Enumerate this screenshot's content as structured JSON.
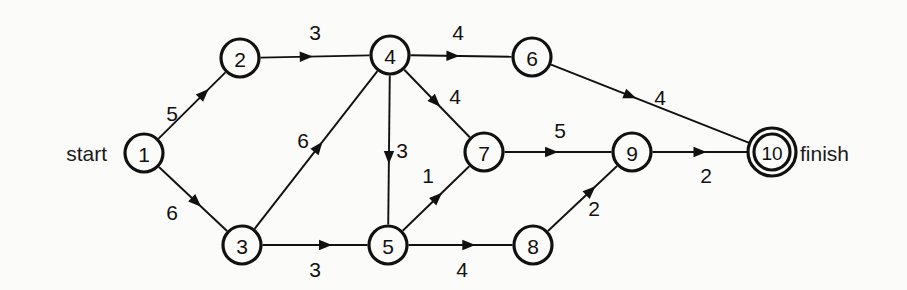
{
  "figure": {
    "type": "directed-network-graph",
    "background_color": "#fbfbf9",
    "ink_color": "#111111",
    "width": 907,
    "height": 290
  },
  "terminals": {
    "start_label": "start",
    "finish_label": "finish",
    "start_node": "1",
    "finish_node": "10"
  },
  "nodes": [
    {
      "id": "1",
      "label": "1",
      "x": 144,
      "y": 153,
      "r": 19,
      "double": false
    },
    {
      "id": "2",
      "label": "2",
      "x": 240,
      "y": 58,
      "r": 19,
      "double": false
    },
    {
      "id": "3",
      "label": "3",
      "x": 242,
      "y": 245,
      "r": 19,
      "double": false
    },
    {
      "id": "4",
      "label": "4",
      "x": 390,
      "y": 55,
      "r": 19,
      "double": false
    },
    {
      "id": "5",
      "label": "5",
      "x": 388,
      "y": 245,
      "r": 19,
      "double": false
    },
    {
      "id": "6",
      "label": "6",
      "x": 532,
      "y": 57,
      "r": 19,
      "double": false
    },
    {
      "id": "7",
      "label": "7",
      "x": 484,
      "y": 152,
      "r": 19,
      "double": false
    },
    {
      "id": "8",
      "label": "8",
      "x": 533,
      "y": 245,
      "r": 19,
      "double": false
    },
    {
      "id": "9",
      "label": "9",
      "x": 632,
      "y": 152,
      "r": 19,
      "double": false
    },
    {
      "id": "10",
      "label": "10",
      "x": 772,
      "y": 152,
      "r": 19,
      "double": true
    }
  ],
  "edges": [
    {
      "from": "1",
      "to": "2",
      "weight": "5",
      "label_x": 172,
      "label_y": 113,
      "arrow_t": 0.68
    },
    {
      "from": "1",
      "to": "3",
      "weight": "6",
      "label_x": 172,
      "label_y": 212,
      "arrow_t": 0.55
    },
    {
      "from": "2",
      "to": "4",
      "weight": "3",
      "label_x": 315,
      "label_y": 32,
      "arrow_t": 0.42
    },
    {
      "from": "3",
      "to": "4",
      "weight": "6",
      "label_x": 303,
      "label_y": 140,
      "arrow_t": 0.52
    },
    {
      "from": "3",
      "to": "5",
      "weight": "3",
      "label_x": 315,
      "label_y": 269,
      "arrow_t": 0.6
    },
    {
      "from": "4",
      "to": "5",
      "weight": "3",
      "label_x": 402,
      "label_y": 150,
      "arrow_t": 0.55
    },
    {
      "from": "4",
      "to": "6",
      "weight": "4",
      "label_x": 458,
      "label_y": 32,
      "arrow_t": 0.42
    },
    {
      "from": "4",
      "to": "7",
      "weight": "4",
      "label_x": 455,
      "label_y": 96,
      "arrow_t": 0.48
    },
    {
      "from": "5",
      "to": "7",
      "weight": "1",
      "label_x": 428,
      "label_y": 175,
      "arrow_t": 0.52
    },
    {
      "from": "5",
      "to": "8",
      "weight": "4",
      "label_x": 462,
      "label_y": 269,
      "arrow_t": 0.58
    },
    {
      "from": "6",
      "to": "10",
      "weight": "4",
      "label_x": 660,
      "label_y": 97,
      "arrow_t": 0.4
    },
    {
      "from": "7",
      "to": "9",
      "weight": "5",
      "label_x": 560,
      "label_y": 130,
      "arrow_t": 0.44
    },
    {
      "from": "8",
      "to": "9",
      "weight": "2",
      "label_x": 594,
      "label_y": 208,
      "arrow_t": 0.62
    },
    {
      "from": "9",
      "to": "10",
      "weight": "2",
      "label_x": 706,
      "label_y": 175,
      "arrow_t": 0.5
    }
  ],
  "chart_data": {
    "type": "diagram",
    "title": "",
    "node_ids": [
      "1",
      "2",
      "3",
      "4",
      "5",
      "6",
      "7",
      "8",
      "9",
      "10"
    ],
    "edge_list": [
      [
        "1",
        "2",
        5
      ],
      [
        "1",
        "3",
        6
      ],
      [
        "2",
        "4",
        3
      ],
      [
        "3",
        "4",
        6
      ],
      [
        "3",
        "5",
        3
      ],
      [
        "4",
        "5",
        3
      ],
      [
        "4",
        "6",
        4
      ],
      [
        "4",
        "7",
        4
      ],
      [
        "5",
        "7",
        1
      ],
      [
        "5",
        "8",
        4
      ],
      [
        "6",
        "10",
        4
      ],
      [
        "7",
        "9",
        5
      ],
      [
        "8",
        "9",
        2
      ],
      [
        "9",
        "10",
        2
      ]
    ],
    "directed": true,
    "start": "1",
    "finish": "10"
  }
}
